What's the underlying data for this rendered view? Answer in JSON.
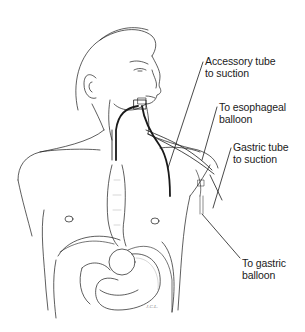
{
  "figure": {
    "line_color": "#1a1a1a",
    "background": "#ffffff"
  },
  "labels": [
    {
      "id": "accessory",
      "line1": "Accessory tube",
      "line2": "to suction"
    },
    {
      "id": "esophageal",
      "line1": "To esophageal",
      "line2": "balloon"
    },
    {
      "id": "gastric-suction",
      "line1": "Gastric tube",
      "line2": "to suction"
    },
    {
      "id": "gastric-balloon",
      "line1": "To gastric",
      "line2": "balloon"
    }
  ],
  "signature": "J.C.L."
}
